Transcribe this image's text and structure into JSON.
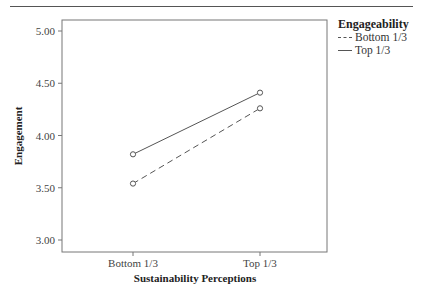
{
  "chart_data": {
    "type": "line",
    "title": "",
    "xlabel": "Sustainability Perceptions",
    "ylabel": "Engagement",
    "categories": [
      "Bottom 1/3",
      "Top 1/3"
    ],
    "ylim": [
      3.0,
      5.0
    ],
    "yticks": [
      "3.00",
      "3.50",
      "4.00",
      "4.50",
      "5.00"
    ],
    "grid": false,
    "legend_title": "Engageability",
    "legend_position": "right",
    "series": [
      {
        "name": "Bottom 1/3",
        "style": "dashed",
        "values": [
          3.54,
          4.26
        ]
      },
      {
        "name": "Top 1/3",
        "style": "solid",
        "values": [
          3.82,
          4.41
        ]
      }
    ]
  },
  "legend": {
    "title": "Engageability",
    "items": [
      {
        "label": "Bottom 1/3",
        "style": "dashed"
      },
      {
        "label": "Top 1/3",
        "style": "solid"
      }
    ]
  },
  "axes": {
    "x_title": "Sustainability Perceptions",
    "y_title": "Engagement",
    "x_ticks": [
      "Bottom 1/3",
      "Top 1/3"
    ],
    "y_ticks": [
      "5.00",
      "4.50",
      "4.00",
      "3.50",
      "3.00"
    ]
  }
}
